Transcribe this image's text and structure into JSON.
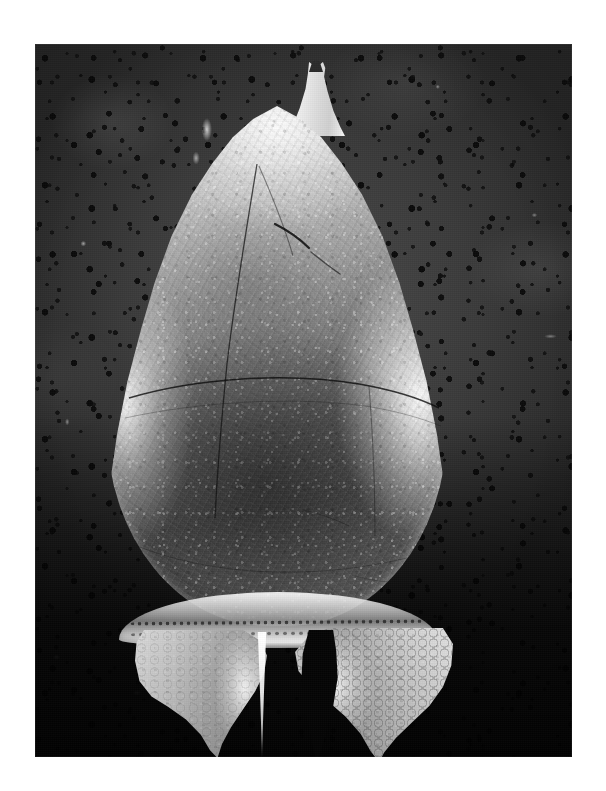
{
  "page": {
    "background_color": "#ffffff",
    "width": 606,
    "height": 791
  },
  "figure": {
    "kind": "sem-micrograph",
    "caption": "",
    "print": {
      "x": 35,
      "y": 44,
      "width": 537,
      "height": 713,
      "tone": "black-and-white"
    },
    "background": {
      "name": "porous-membrane-filter",
      "color": "#343434",
      "pore_color": "#0b0b0b",
      "shadow_color": "#050505"
    },
    "specimen": {
      "name": "dinoflagellate-cell",
      "colors": {
        "highlight": "#ffffff",
        "midtone": "#9a9a9a",
        "shadow": "#4e4e4e",
        "suture": "#1a1a1a"
      },
      "parts": [
        {
          "name": "apical-horn",
          "label": "apical horn"
        },
        {
          "name": "epitheca",
          "label": "epitheca"
        },
        {
          "name": "cingulum",
          "label": "cingulum"
        },
        {
          "name": "antapical-horn-left",
          "label": "left antapical horn"
        },
        {
          "name": "antapical-horn-right",
          "label": "right antapical horn"
        }
      ]
    }
  }
}
